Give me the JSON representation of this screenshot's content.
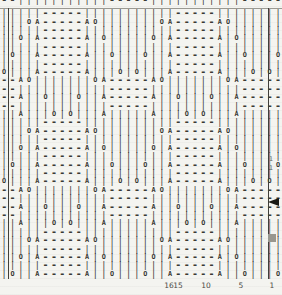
{
  "chart": {
    "partial_top_row": "--|||||||||||-----|||||||||||-----",
    "rows": [
      "|||||-----|||||||||||-----||||||||",
      "|||OA-----AO|||||||OA-----AO||||||",
      "|||||-----|||||||||||-----||||||||",
      "||O|A-----A|O|||||O|A-----A|O|||||",
      "|||||-----|||||||||||-----||||||||",
      "|O||A-----A||O|||O||A-----A||O|||O",
      "|||||-----|||||||||||-----||||||||",
      "O|||A-----A|||O|O|||A-----A|||O|O|",
      "--AO|||||||OA-----AO|||||||OA-----",
      "--|||||||||||-----|||||||||||-----",
      "--A||O|||O||A-----A||O|||O||A-----",
      "--|||||||||||-----|||||||||||-----",
      "||A|||O|O|||A|||||A|||O|O|||A|||||",
      "|||||-----|||||||||||-----||||||||",
      "|||OA-----AO|||||||OA-----AO||||||",
      "|||||-----|||||||||||-----||||||||",
      "||O|A-----A|O|||||O|A-----A|O|||||",
      "|||||-----|||||||||||-----||||||||",
      "|O||A-----A||O|||O||A-----A||O|||O",
      "|||||-----|||||||||||-----||||||||",
      "O|||A-----A|||O|O|||A-----A|||O|O|",
      "--AO|||||||OA-----AO|||||||OA-----",
      "--|||||||||||-----|||||||||||-----",
      "--A||O|||O||A-----A||O|||O||A-----",
      "--|||||||||||-----|||||||||||-----",
      "||A|||O|O|||A|||||A|||O|O|||A|||||",
      "|||||-----|||||||||||-----||||||||",
      "|||OA-----AO|||||||OA-----AO||||||",
      "|||||-----|||||||||||-----||||||||",
      "||O|A-----A|O|||||O|A-----A|O|||||",
      "|||||-----|||||||||||-----||||||||",
      "|O||A-----A||O|||O||A-----A||O|||O"
    ],
    "symbols": {
      "knit": "|",
      "purl": "-",
      "yarn_over": "O",
      "decrease": "A"
    },
    "stitch_numbers": [
      {
        "label": "16",
        "x": 169
      },
      {
        "label": "15",
        "x": 178
      },
      {
        "label": "10",
        "x": 206
      },
      {
        "label": "5",
        "x": 241
      },
      {
        "label": "1",
        "x": 272
      }
    ],
    "repeat_line_x": [
      8,
      268
    ],
    "grid_top": 9,
    "row_marks": [
      {
        "label": "1",
        "y": 155
      },
      {
        "label": "1",
        "y": 164
      }
    ],
    "arrow_marker_y": 198,
    "square_marker_y": 234
  },
  "colors": {
    "background": "#f4f4f0",
    "symbol": "#35342f",
    "border": "#9a9992",
    "repeat_line": "#403f3a",
    "arrow": "#191914",
    "square": "#98978f"
  }
}
